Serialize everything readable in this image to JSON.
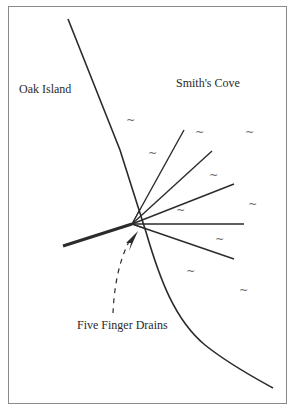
{
  "diagram": {
    "labels": {
      "land": "Oak Island",
      "water": "Smith's Cove",
      "feature": "Five Finger Drains"
    },
    "wave_glyph": "~",
    "colors": {
      "line": "#2b2b2b",
      "frame": "#8a8a8a",
      "wave": "#6a6a6a",
      "background": "#ffffff"
    }
  }
}
